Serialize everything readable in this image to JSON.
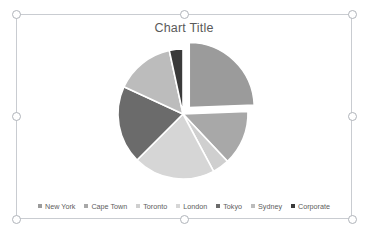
{
  "chart_object": {
    "selected": true,
    "handles": [
      "top-left",
      "top-center",
      "top-right",
      "middle-left",
      "middle-right",
      "bottom-left",
      "bottom-center",
      "bottom-right"
    ]
  },
  "chart_data": {
    "type": "pie",
    "title": "Chart Title",
    "xlabel": "",
    "ylabel": "",
    "legend_position": "bottom",
    "grid": false,
    "start_angle": 0,
    "exploded_slice": "New York",
    "categories": [
      "New York",
      "Cape Town",
      "Toronto",
      "London",
      "Tokyo",
      "Sydney",
      "Corporate"
    ],
    "values": [
      24.4,
      13.6,
      4.2,
      20.3,
      19.4,
      14.7,
      3.4
    ],
    "percentages": [
      "24.4%",
      "13.6%",
      "4.2%",
      "20.3%",
      "19.4%",
      "14.7%",
      "3.4%"
    ],
    "colors": [
      "#9b9b9b",
      "#a8a8a8",
      "#cfcfcf",
      "#d6d6d6",
      "#6b6b6b",
      "#bcbcbc",
      "#3a3a3a"
    ],
    "slices": [
      {
        "label": "New York",
        "value": 24.4,
        "color": "#9b9b9b",
        "start": 0,
        "end": 87.8,
        "exploded": true
      },
      {
        "label": "Cape Town",
        "value": 13.6,
        "color": "#a8a8a8",
        "start": 87.8,
        "end": 136.8,
        "exploded": false
      },
      {
        "label": "Toronto",
        "value": 4.2,
        "color": "#cfcfcf",
        "start": 136.8,
        "end": 151.9,
        "exploded": false
      },
      {
        "label": "London",
        "value": 20.3,
        "color": "#d6d6d6",
        "start": 151.9,
        "end": 225.0,
        "exploded": false
      },
      {
        "label": "Tokyo",
        "value": 19.4,
        "color": "#6b6b6b",
        "start": 225.0,
        "end": 294.8,
        "exploded": false
      },
      {
        "label": "Sydney",
        "value": 14.7,
        "color": "#bcbcbc",
        "start": 294.8,
        "end": 347.8,
        "exploded": false
      },
      {
        "label": "Corporate",
        "value": 3.4,
        "color": "#3a3a3a",
        "start": 347.8,
        "end": 360.0,
        "exploded": false
      }
    ]
  },
  "legend": {
    "items": [
      {
        "label": "New York",
        "color": "#9b9b9b"
      },
      {
        "label": "Cape Town",
        "color": "#a8a8a8"
      },
      {
        "label": "Toronto",
        "color": "#cfcfcf"
      },
      {
        "label": "London",
        "color": "#d6d6d6"
      },
      {
        "label": "Tokyo",
        "color": "#6b6b6b"
      },
      {
        "label": "Sydney",
        "color": "#bcbcbc"
      },
      {
        "label": "Corporate",
        "color": "#3a3a3a"
      }
    ]
  },
  "theme": {
    "background": "#ffffff",
    "frame_border": "#c9ccd1",
    "handle_fill": "#ffffff",
    "handle_border": "#b0b4ba",
    "title_color": "#5a5a5a",
    "legend_text_color": "#5d5d5d"
  }
}
